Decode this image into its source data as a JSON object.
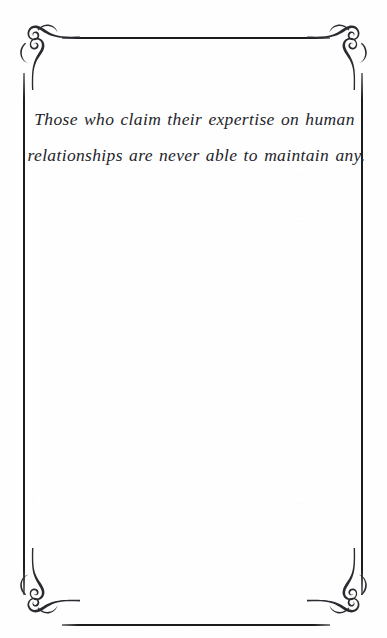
{
  "page": {
    "background_color": "#fefefe",
    "ink_color": "#24242a",
    "border_color": "#1c1c1e"
  },
  "quote": {
    "line_1": "Those who claim their expertise on human",
    "line_2": "relationships are never able to maintain any.",
    "full_text": "Those who claim their expertise on human relationships are never able to maintain any."
  },
  "border": {
    "top_rule": "",
    "bottom_rule": "",
    "left_rule": "",
    "right_rule": ""
  },
  "ornaments": {
    "top_left": "corner-flourish-ornament",
    "top_right": "corner-flourish-ornament",
    "bottom_left": "corner-flourish-ornament",
    "bottom_right": "corner-flourish-ornament"
  }
}
